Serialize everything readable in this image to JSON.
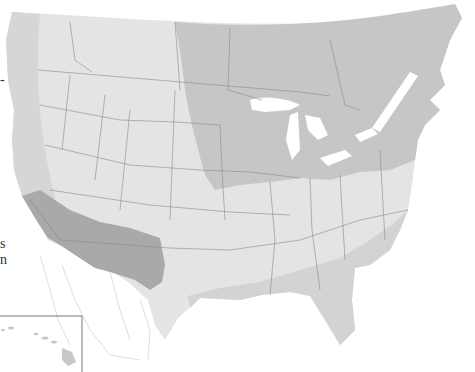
{
  "map": {
    "subject": "North America (United States and southern Canada) zone map",
    "colors": {
      "background": "#ffffff",
      "zone_light": "#e4e4e4",
      "zone_medium": "#d3d3d3",
      "zone_dark_north": "#c3c3c3",
      "zone_dark_southwest": "#a9a9a9",
      "mexico_fill": "#ffffff",
      "borders": "#8a8a8a",
      "water": "#ffffff"
    },
    "zones": [
      {
        "name": "pacific-coast-zone",
        "shade": "medium"
      },
      {
        "name": "interior-west-zone",
        "shade": "light"
      },
      {
        "name": "northern-east-zone",
        "shade": "dark"
      },
      {
        "name": "southwest-desert-zone",
        "shade": "darkest"
      },
      {
        "name": "southern-coastal-zone",
        "shade": "medium"
      }
    ],
    "inset": {
      "name": "hawaii-inset"
    }
  },
  "edge_text": {
    "fragment_1": "-",
    "fragment_2": "s",
    "fragment_3": "n"
  }
}
